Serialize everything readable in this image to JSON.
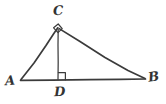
{
  "figure": {
    "background_color": "#ffffff",
    "stroke_color": "#3b3b3b",
    "label_color": "#333333",
    "width": 166,
    "height": 104,
    "vertices": [
      {
        "id": "A",
        "label": "A",
        "x": 21,
        "y": 80,
        "label_x": 8,
        "label_y": 83,
        "position": "left of vertex"
      },
      {
        "id": "B",
        "label": "B",
        "x": 145,
        "y": 79,
        "label_x": 153,
        "label_y": 79,
        "position": "right of vertex"
      },
      {
        "id": "C",
        "label": "C",
        "x": 58,
        "y": 27,
        "label_x": 58,
        "label_y": 13,
        "position": "above vertex"
      },
      {
        "id": "D",
        "label": "D",
        "x": 58,
        "y": 80,
        "label_x": 58,
        "label_y": 93,
        "position": "below vertex"
      }
    ],
    "segments": [
      {
        "id": "AB",
        "from": "A",
        "to": "B",
        "role": "hypotenuse-base"
      },
      {
        "id": "AC",
        "from": "A",
        "to": "C",
        "role": "leg"
      },
      {
        "id": "CB",
        "from": "C",
        "to": "B",
        "role": "leg"
      },
      {
        "id": "CD",
        "from": "C",
        "to": "D",
        "role": "altitude"
      }
    ],
    "right_angles": [
      {
        "id": "angle-C",
        "at": "C",
        "marker": "diamond",
        "between": [
          "CA",
          "CB"
        ]
      },
      {
        "id": "angle-D",
        "at": "D",
        "marker": "square",
        "between": [
          "DC",
          "DB"
        ]
      }
    ],
    "style": "hand-drawn pencil sketch"
  }
}
